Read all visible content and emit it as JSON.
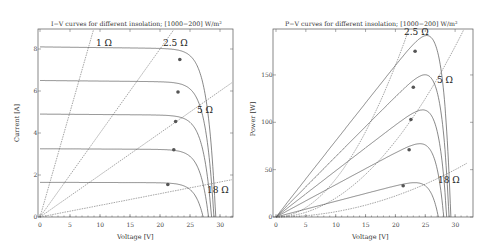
{
  "chart_data": [
    {
      "type": "line",
      "title": "I-V curves for different insolation; [1000-200] W/m²",
      "xlabel": "Voltage [V]",
      "ylabel": "Current [A]",
      "xlim": [
        0,
        32
      ],
      "ylim": [
        0,
        9
      ],
      "xticks": [
        "0",
        "5",
        "10",
        "15",
        "20",
        "25",
        "30"
      ],
      "yticks": [
        "0",
        "2",
        "4",
        "6",
        "8"
      ],
      "grid": false,
      "series": [
        {
          "name": "1000 W/m²",
          "isc": 8.1,
          "voc": 29.3,
          "mpp": [
            23.3,
            7.5
          ]
        },
        {
          "name": "800 W/m²",
          "isc": 6.5,
          "voc": 29.0,
          "mpp": [
            23.0,
            5.95
          ]
        },
        {
          "name": "600 W/m²",
          "isc": 4.9,
          "voc": 28.6,
          "mpp": [
            22.6,
            4.55
          ]
        },
        {
          "name": "400 W/m²",
          "isc": 3.25,
          "voc": 28.1,
          "mpp": [
            22.3,
            3.2
          ]
        },
        {
          "name": "200 W/m²",
          "isc": 1.65,
          "voc": 27.2,
          "mpp": [
            21.3,
            1.55
          ]
        }
      ],
      "load_lines": [
        {
          "label": "1 Ω",
          "resistance": 1
        },
        {
          "label": "2.5 Ω",
          "resistance": 2.5
        },
        {
          "label": "5 Ω",
          "resistance": 5
        },
        {
          "label": "18 Ω",
          "resistance": 18
        }
      ]
    },
    {
      "type": "line",
      "title": "P-V curves for different insolation; [1000-200] W/m²",
      "xlabel": "Voltage [V]",
      "ylabel": "Power [W]",
      "xlim": [
        0,
        32
      ],
      "ylim": [
        0,
        190
      ],
      "xticks": [
        "0",
        "5",
        "10",
        "15",
        "20",
        "25",
        "30"
      ],
      "yticks": [
        "0",
        "50",
        "100",
        "150"
      ],
      "grid": false,
      "series": [
        {
          "name": "1000 W/m²",
          "voc": 29.3,
          "mpp": [
            23.3,
            175
          ]
        },
        {
          "name": "800 W/m²",
          "voc": 29.0,
          "mpp": [
            23.0,
            137
          ]
        },
        {
          "name": "600 W/m²",
          "voc": 28.6,
          "mpp": [
            22.6,
            103
          ]
        },
        {
          "name": "400 W/m²",
          "voc": 28.1,
          "mpp": [
            22.3,
            71
          ]
        },
        {
          "name": "200 W/m²",
          "voc": 27.2,
          "mpp": [
            21.3,
            33
          ]
        }
      ],
      "load_lines": [
        {
          "label": "2.5 Ω",
          "resistance": 2.5
        },
        {
          "label": "5 Ω",
          "resistance": 5
        },
        {
          "label": "18 Ω",
          "resistance": 18
        }
      ]
    }
  ],
  "left": {
    "title": "I−V curves for different insolation; [1000−200] W/m²",
    "xlabel": "Voltage [V]",
    "ylabel": "Current [A]",
    "labels": {
      "r1": "1 Ω",
      "r25": "2.5 Ω",
      "r5": "5 Ω",
      "r18": "18 Ω"
    },
    "xticks": [
      "0",
      "5",
      "10",
      "15",
      "20",
      "25",
      "30"
    ],
    "yticks": [
      "0",
      "2",
      "4",
      "6",
      "8"
    ]
  },
  "right": {
    "title": "P−V curves for different insolation; [1000−200] W/m²",
    "xlabel": "Voltage [V]",
    "ylabel": "Power [W]",
    "labels": {
      "r25": "2.5 Ω",
      "r5": "5 Ω",
      "r18": "18 Ω"
    },
    "xticks": [
      "0",
      "5",
      "10",
      "15",
      "20",
      "25",
      "30"
    ],
    "yticks": [
      "0",
      "50",
      "100",
      "150"
    ]
  }
}
